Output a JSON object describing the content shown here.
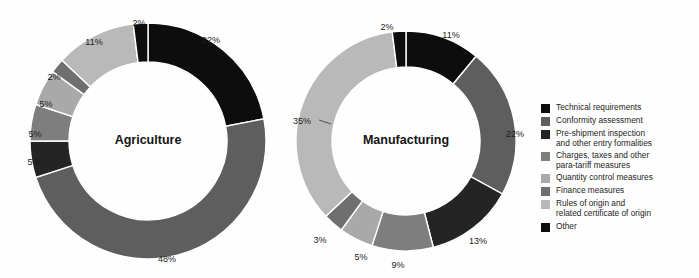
{
  "chart_data": [
    {
      "type": "pie",
      "title": "Agriculture",
      "categories": [
        "Technical requirements",
        "Conformity assessment",
        "Pre-shipment inspection and other entry formalities",
        "Charges, taxes and other para-tariff measures",
        "Quantity control measures",
        "Finance measures",
        "Rules of origin and related certificate of origin",
        "Other"
      ],
      "values": [
        22,
        48,
        5,
        5,
        5,
        2,
        11,
        2
      ],
      "labels": [
        "22%",
        "48%",
        "5%",
        "5%",
        "5%",
        "2%",
        "11%",
        "2%"
      ],
      "colors": [
        "#0d0d0d",
        "#5e5e5e",
        "#242424",
        "#7e7e7e",
        "#a9a9a9",
        "#6f6f6f",
        "#b9b9b9",
        "#0d0d0d"
      ],
      "xlabel": "",
      "ylabel": "",
      "legend_position": "right",
      "grid": false
    },
    {
      "type": "pie",
      "title": "Manufacturing",
      "categories": [
        "Technical requirements",
        "Conformity assessment",
        "Pre-shipment inspection and other entry formalities",
        "Charges, taxes and other para-tariff measures",
        "Quantity control measures",
        "Finance measures",
        "Rules of origin and related certificate of origin",
        "Other"
      ],
      "values": [
        11,
        22,
        13,
        9,
        5,
        3,
        35,
        2
      ],
      "labels": [
        "11%",
        "22%",
        "13%",
        "9%",
        "5%",
        "3%",
        "35%",
        "2%"
      ],
      "colors": [
        "#0d0d0d",
        "#5e5e5e",
        "#242424",
        "#7e7e7e",
        "#a9a9a9",
        "#6f6f6f",
        "#b9b9b9",
        "#0d0d0d"
      ],
      "xlabel": "",
      "ylabel": "",
      "legend_position": "right",
      "grid": false
    }
  ],
  "charts": {
    "agriculture": {
      "title": "Agriculture",
      "labels": {
        "technical": "22%",
        "conformity": "48%",
        "preshipment": "5%",
        "charges": "5%",
        "quantity": "5%",
        "finance": "2%",
        "rules": "11%",
        "other": "2%"
      }
    },
    "manufacturing": {
      "title": "Manufacturing",
      "labels": {
        "technical": "11%",
        "conformity": "22%",
        "preshipment": "13%",
        "charges": "9%",
        "quantity": "5%",
        "finance": "3%",
        "rules": "35%",
        "other": "2%"
      }
    }
  },
  "legend": {
    "items": [
      {
        "label": "Technical requirements",
        "color": "#0d0d0d"
      },
      {
        "label": "Conformity assessment",
        "color": "#5e5e5e"
      },
      {
        "label": "Pre-shipment inspection\nand other entry formalities",
        "color": "#242424"
      },
      {
        "label": "Charges, taxes and other\npara-tariff measures",
        "color": "#7e7e7e"
      },
      {
        "label": "Quantity control measures",
        "color": "#a9a9a9"
      },
      {
        "label": "Finance measures",
        "color": "#6f6f6f"
      },
      {
        "label": "Rules of origin and\nrelated certificate of origin",
        "color": "#b9b9b9"
      },
      {
        "label": "Other",
        "color": "#0d0d0d"
      }
    ]
  }
}
